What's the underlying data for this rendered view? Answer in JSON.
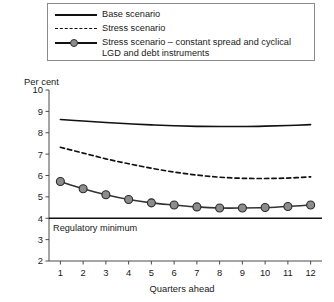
{
  "legend": {
    "items": [
      {
        "key": "solid-line",
        "label": "Base scenario"
      },
      {
        "key": "dashed-line",
        "label": "Stress scenario"
      },
      {
        "key": "marker-line",
        "label": "Stress scenario – constant spread and cyclical\nLGD and debt instruments"
      }
    ]
  },
  "chart_data": {
    "type": "line",
    "title": "",
    "xlabel": "Quarters ahead",
    "ylabel": "Per cent",
    "x": [
      1,
      2,
      3,
      4,
      5,
      6,
      7,
      8,
      9,
      10,
      11,
      12
    ],
    "xtick_labels": [
      "1",
      "2",
      "3",
      "4",
      "5",
      "6",
      "7",
      "8",
      "9",
      "10",
      "11",
      "12"
    ],
    "xlim": [
      0.5,
      12.5
    ],
    "ylim": [
      2,
      10
    ],
    "ytick_labels": [
      "2",
      "3",
      "4",
      "5",
      "6",
      "7",
      "8",
      "9",
      "10"
    ],
    "yticks": [
      2,
      3,
      4,
      5,
      6,
      7,
      8,
      9,
      10
    ],
    "grid": false,
    "legend_position": "above-plot",
    "series": [
      {
        "name": "Base scenario",
        "style": "solid",
        "color": "#111111",
        "markers": false,
        "values": [
          8.62,
          8.55,
          8.48,
          8.42,
          8.37,
          8.33,
          8.3,
          8.29,
          8.29,
          8.31,
          8.34,
          8.38
        ]
      },
      {
        "name": "Stress scenario",
        "style": "dashed",
        "color": "#111111",
        "markers": false,
        "values": [
          7.32,
          7.05,
          6.78,
          6.55,
          6.34,
          6.16,
          6.02,
          5.92,
          5.87,
          5.86,
          5.88,
          5.94
        ]
      },
      {
        "name": "Stress scenario – constant spread and cyclical LGD and debt instruments",
        "style": "solid-markers",
        "color": "#333333",
        "marker_fill": "#8c8c8c",
        "markers": true,
        "values": [
          5.72,
          5.38,
          5.1,
          4.88,
          4.72,
          4.62,
          4.53,
          4.48,
          4.48,
          4.5,
          4.55,
          4.62
        ]
      }
    ],
    "annotations": [
      {
        "name": "regulatory-minimum",
        "text": "Regulatory minimum",
        "value": 4.0,
        "style": "solid-horizontal-line"
      }
    ]
  }
}
